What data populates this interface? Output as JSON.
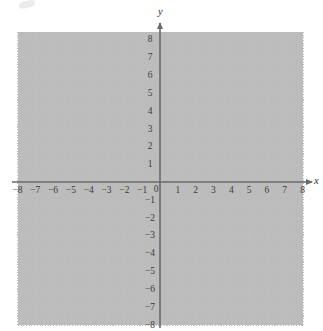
{
  "figure": {
    "kind": "cartesian-coordinate-plane",
    "background_color": "#ffffff",
    "axis_color": "#6a6a6a",
    "grid_color": "#bdbdbd",
    "label_color": "#3b3b3b"
  },
  "axes": {
    "x_axis_name": "x",
    "y_axis_name": "y",
    "origin_label": "0"
  },
  "chart_data": {
    "type": "scatter",
    "title": "",
    "xlabel": "x",
    "ylabel": "y",
    "xlim": [
      -8,
      8
    ],
    "ylim": [
      -8,
      8
    ],
    "grid": true,
    "legend": null,
    "series": [],
    "x_tick_labels": [
      "−8",
      "−7",
      "−6",
      "−5",
      "−4",
      "−3",
      "−2",
      "−1",
      "0",
      "1",
      "2",
      "3",
      "4",
      "5",
      "6",
      "7",
      "8"
    ],
    "x_tick_values": [
      -8,
      -7,
      -6,
      -5,
      -4,
      -3,
      -2,
      -1,
      0,
      1,
      2,
      3,
      4,
      5,
      6,
      7,
      8
    ],
    "y_tick_labels": [
      "8",
      "7",
      "6",
      "5",
      "4",
      "3",
      "2",
      "1",
      "−1",
      "−2",
      "−3",
      "−4",
      "−5",
      "−6",
      "−7",
      "−8"
    ],
    "y_tick_values": [
      8,
      7,
      6,
      5,
      4,
      3,
      2,
      1,
      -1,
      -2,
      -3,
      -4,
      -5,
      -6,
      -7,
      -8
    ]
  }
}
